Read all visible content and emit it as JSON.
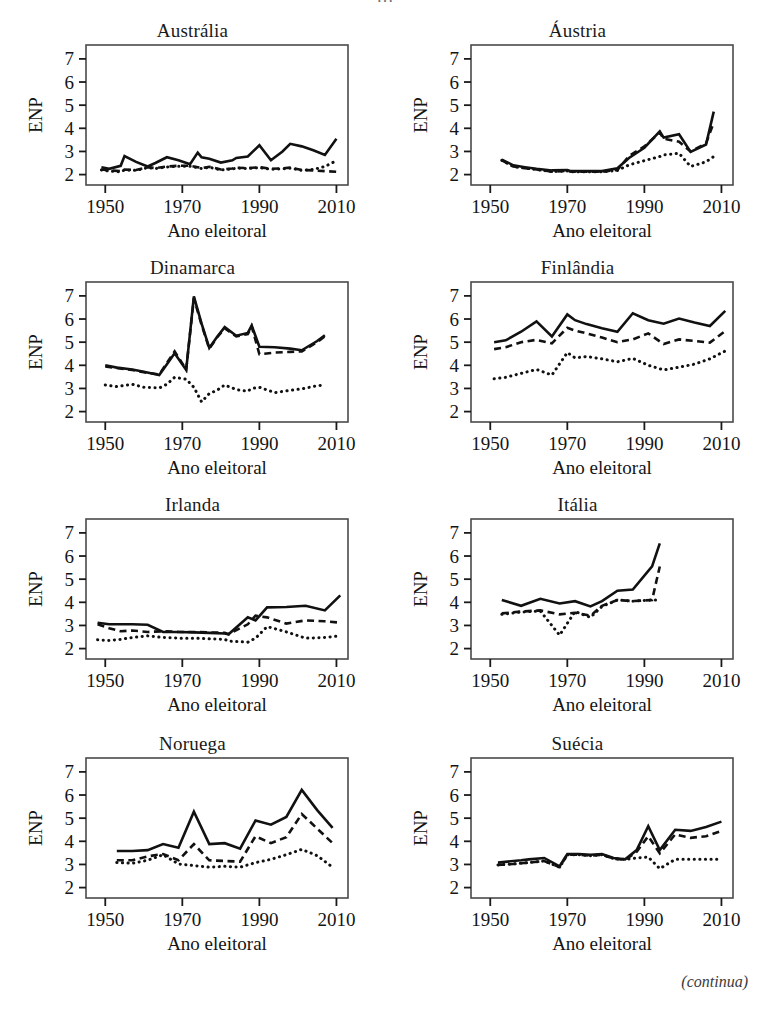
{
  "figure": {
    "cropped_header_text": "…",
    "continued_note": "(continua)",
    "axis": {
      "xlabel": "Ano eleitoral",
      "ylabel": "ENP",
      "x_ticks": [
        1950,
        1970,
        1990,
        2010
      ],
      "y_ticks": [
        2,
        3,
        4,
        5,
        6,
        7
      ],
      "xlim": [
        1945,
        2013
      ],
      "ylim": [
        1.55,
        7.6
      ]
    },
    "series_styles": [
      "solid",
      "dashed",
      "dotted"
    ],
    "line_color": "#111111"
  },
  "chart_data": [
    {
      "type": "line",
      "title": "Austrália",
      "xlabel": "Ano eleitoral",
      "ylabel": "ENP",
      "xlim": [
        1945,
        2013
      ],
      "ylim": [
        1.55,
        7.6
      ],
      "x_ticks": [
        1950,
        1970,
        1990,
        2010
      ],
      "y_ticks": [
        2,
        3,
        4,
        5,
        6,
        7
      ],
      "grid": false,
      "legend": "none",
      "x": [
        1949,
        1951,
        1954,
        1955,
        1958,
        1961,
        1963,
        1966,
        1969,
        1972,
        1974,
        1975,
        1977,
        1980,
        1983,
        1984,
        1987,
        1990,
        1993,
        1996,
        1998,
        2001,
        2004,
        2007,
        2010
      ],
      "series": [
        {
          "name": "solid",
          "style": "solid",
          "values": [
            2.32,
            2.25,
            2.38,
            2.8,
            2.55,
            2.35,
            2.5,
            2.75,
            2.62,
            2.45,
            2.95,
            2.75,
            2.68,
            2.52,
            2.62,
            2.72,
            2.78,
            3.27,
            2.62,
            3.0,
            3.33,
            3.22,
            3.05,
            2.85,
            3.55
          ]
        },
        {
          "name": "dashed",
          "style": "dashed",
          "values": [
            2.22,
            2.18,
            2.15,
            2.22,
            2.2,
            2.32,
            2.28,
            2.35,
            2.38,
            2.38,
            2.32,
            2.28,
            2.34,
            2.22,
            2.26,
            2.3,
            2.28,
            2.32,
            2.25,
            2.27,
            2.3,
            2.2,
            2.18,
            2.15,
            2.12
          ]
        },
        {
          "name": "dotted",
          "style": "dotted",
          "values": [
            2.2,
            2.15,
            2.12,
            2.2,
            2.18,
            2.3,
            2.26,
            2.33,
            2.36,
            2.36,
            2.3,
            2.26,
            2.32,
            2.2,
            2.24,
            2.28,
            2.26,
            2.3,
            2.23,
            2.25,
            2.28,
            2.18,
            2.22,
            2.35,
            2.6
          ]
        }
      ]
    },
    {
      "type": "line",
      "title": "Áustria",
      "xlabel": "Ano eleitoral",
      "ylabel": "ENP",
      "xlim": [
        1945,
        2013
      ],
      "ylim": [
        1.55,
        7.6
      ],
      "x_ticks": [
        1950,
        1970,
        1990,
        2010
      ],
      "y_ticks": [
        2,
        3,
        4,
        5,
        6,
        7
      ],
      "grid": false,
      "legend": "none",
      "x": [
        1953,
        1956,
        1959,
        1962,
        1966,
        1970,
        1971,
        1975,
        1979,
        1983,
        1986,
        1990,
        1994,
        1995,
        1999,
        2002,
        2006,
        2008
      ],
      "series": [
        {
          "name": "solid",
          "style": "solid",
          "values": [
            2.65,
            2.4,
            2.32,
            2.25,
            2.18,
            2.2,
            2.15,
            2.15,
            2.15,
            2.27,
            2.72,
            3.16,
            3.87,
            3.6,
            3.74,
            2.98,
            3.3,
            4.72
          ]
        },
        {
          "name": "dashed",
          "style": "dashed",
          "values": [
            2.62,
            2.35,
            2.28,
            2.22,
            2.13,
            2.16,
            2.12,
            2.12,
            2.12,
            2.2,
            2.8,
            3.22,
            3.82,
            3.55,
            3.42,
            3.0,
            3.35,
            4.25
          ]
        },
        {
          "name": "dotted",
          "style": "dotted",
          "values": [
            2.62,
            2.35,
            2.28,
            2.22,
            2.13,
            2.16,
            2.12,
            2.12,
            2.12,
            2.18,
            2.42,
            2.6,
            2.78,
            2.85,
            2.92,
            2.35,
            2.55,
            2.78
          ]
        }
      ]
    },
    {
      "type": "line",
      "title": "Dinamarca",
      "xlabel": "Ano eleitoral",
      "ylabel": "ENP",
      "xlim": [
        1945,
        2013
      ],
      "ylim": [
        1.55,
        7.6
      ],
      "x_ticks": [
        1950,
        1970,
        1990,
        2010
      ],
      "y_ticks": [
        2,
        3,
        4,
        5,
        6,
        7
      ],
      "grid": false,
      "legend": "none",
      "x": [
        1950,
        1953,
        1957,
        1960,
        1964,
        1966,
        1968,
        1971,
        1973,
        1975,
        1977,
        1979,
        1981,
        1984,
        1987,
        1988,
        1990,
        1994,
        1998,
        2001,
        2005,
        2007
      ],
      "series": [
        {
          "name": "solid",
          "style": "solid",
          "values": [
            4.0,
            3.9,
            3.82,
            3.72,
            3.58,
            4.05,
            4.52,
            3.8,
            6.98,
            5.8,
            4.75,
            5.22,
            5.65,
            5.28,
            5.4,
            5.72,
            4.8,
            4.78,
            4.72,
            4.65,
            5.05,
            5.3
          ]
        },
        {
          "name": "dashed",
          "style": "dashed",
          "values": [
            3.95,
            3.88,
            3.8,
            3.7,
            3.6,
            4.1,
            4.6,
            3.82,
            6.9,
            5.75,
            4.72,
            5.2,
            5.6,
            5.25,
            5.35,
            5.68,
            4.48,
            4.55,
            4.58,
            4.6,
            5.0,
            5.25
          ]
        },
        {
          "name": "dotted",
          "style": "dotted",
          "values": [
            3.15,
            3.08,
            3.18,
            3.05,
            3.02,
            3.18,
            3.48,
            3.4,
            3.05,
            2.42,
            2.78,
            2.92,
            3.15,
            2.95,
            2.88,
            3.0,
            3.05,
            2.82,
            2.92,
            2.98,
            3.12,
            3.15
          ]
        }
      ]
    },
    {
      "type": "line",
      "title": "Finlândia",
      "xlabel": "Ano eleitoral",
      "ylabel": "ENP",
      "xlim": [
        1945,
        2013
      ],
      "ylim": [
        1.55,
        7.6
      ],
      "x_ticks": [
        1950,
        1970,
        1990,
        2010
      ],
      "y_ticks": [
        2,
        3,
        4,
        5,
        6,
        7
      ],
      "grid": false,
      "legend": "none",
      "x": [
        1951,
        1954,
        1958,
        1962,
        1966,
        1970,
        1972,
        1975,
        1979,
        1983,
        1987,
        1991,
        1995,
        1999,
        2003,
        2007,
        2011
      ],
      "series": [
        {
          "name": "solid",
          "style": "solid",
          "values": [
            5.0,
            5.08,
            5.45,
            5.9,
            5.25,
            6.2,
            5.95,
            5.78,
            5.6,
            5.45,
            6.25,
            5.95,
            5.8,
            6.02,
            5.85,
            5.7,
            6.35
          ]
        },
        {
          "name": "dashed",
          "style": "dashed",
          "values": [
            4.7,
            4.78,
            5.0,
            5.1,
            4.95,
            5.62,
            5.5,
            5.38,
            5.2,
            5.0,
            5.12,
            5.38,
            4.92,
            5.12,
            5.05,
            4.98,
            5.48
          ]
        },
        {
          "name": "dotted",
          "style": "dotted",
          "values": [
            3.42,
            3.48,
            3.65,
            3.82,
            3.58,
            4.55,
            4.32,
            4.38,
            4.28,
            4.15,
            4.3,
            4.0,
            3.8,
            3.92,
            4.05,
            4.28,
            4.62
          ]
        }
      ]
    },
    {
      "type": "line",
      "title": "Irlanda",
      "xlabel": "Ano eleitoral",
      "ylabel": "ENP",
      "xlim": [
        1945,
        2013
      ],
      "ylim": [
        1.55,
        7.6
      ],
      "x_ticks": [
        1950,
        1970,
        1990,
        2010
      ],
      "y_ticks": [
        2,
        3,
        4,
        5,
        6,
        7
      ],
      "grid": false,
      "legend": "none",
      "x": [
        1948,
        1951,
        1954,
        1957,
        1961,
        1965,
        1969,
        1973,
        1977,
        1981,
        1982,
        1987,
        1989,
        1992,
        1997,
        2002,
        2007,
        2011
      ],
      "series": [
        {
          "name": "solid",
          "style": "solid",
          "values": [
            3.12,
            3.05,
            3.05,
            3.05,
            3.03,
            2.72,
            2.72,
            2.7,
            2.68,
            2.65,
            2.62,
            3.35,
            3.22,
            3.78,
            3.8,
            3.85,
            3.65,
            4.3
          ]
        },
        {
          "name": "dashed",
          "style": "dashed",
          "values": [
            3.05,
            2.88,
            2.75,
            2.78,
            2.72,
            2.75,
            2.72,
            2.72,
            2.7,
            2.68,
            2.62,
            3.05,
            3.42,
            3.35,
            3.08,
            3.22,
            3.18,
            3.12
          ]
        },
        {
          "name": "dotted",
          "style": "dotted",
          "values": [
            2.38,
            2.35,
            2.4,
            2.48,
            2.55,
            2.48,
            2.45,
            2.45,
            2.42,
            2.4,
            2.32,
            2.28,
            2.45,
            2.95,
            2.72,
            2.45,
            2.48,
            2.55
          ]
        }
      ]
    },
    {
      "type": "line",
      "title": "Itália",
      "xlabel": "Ano eleitoral",
      "ylabel": "ENP",
      "xlim": [
        1945,
        2013
      ],
      "ylim": [
        1.55,
        7.6
      ],
      "x_ticks": [
        1950,
        1970,
        1990,
        2010
      ],
      "y_ticks": [
        2,
        3,
        4,
        5,
        6,
        7
      ],
      "grid": false,
      "legend": "none",
      "x": [
        1953,
        1958,
        1963,
        1968,
        1972,
        1976,
        1979,
        1983,
        1987,
        1992,
        1994
      ],
      "series": [
        {
          "name": "solid",
          "style": "solid",
          "values": [
            4.1,
            3.85,
            4.15,
            3.95,
            4.05,
            3.82,
            4.05,
            4.5,
            4.55,
            5.55,
            6.55
          ]
        },
        {
          "name": "dashed",
          "style": "dashed",
          "values": [
            3.52,
            3.6,
            3.65,
            3.48,
            3.55,
            3.42,
            3.85,
            4.1,
            4.05,
            4.1,
            5.55
          ]
        },
        {
          "name": "dotted",
          "style": "dotted",
          "values": [
            3.48,
            3.58,
            3.62,
            2.58,
            3.6,
            3.35,
            3.82,
            4.1,
            4.05,
            4.1,
            4.1
          ]
        }
      ]
    },
    {
      "type": "line",
      "title": "Noruega",
      "xlabel": "Ano eleitoral",
      "ylabel": "ENP",
      "xlim": [
        1945,
        2013
      ],
      "ylim": [
        1.55,
        7.6
      ],
      "x_ticks": [
        1950,
        1970,
        1990,
        2010
      ],
      "y_ticks": [
        2,
        3,
        4,
        5,
        6,
        7
      ],
      "grid": false,
      "legend": "none",
      "x": [
        1953,
        1957,
        1961,
        1965,
        1969,
        1973,
        1977,
        1981,
        1985,
        1989,
        1993,
        1997,
        2001,
        2005,
        2009
      ],
      "series": [
        {
          "name": "solid",
          "style": "solid",
          "values": [
            3.58,
            3.58,
            3.62,
            3.88,
            3.72,
            5.28,
            3.88,
            3.92,
            3.68,
            4.9,
            4.72,
            5.05,
            6.22,
            5.35,
            4.58
          ]
        },
        {
          "name": "dashed",
          "style": "dashed",
          "values": [
            3.18,
            3.18,
            3.35,
            3.45,
            3.18,
            3.88,
            3.18,
            3.15,
            3.12,
            4.22,
            3.92,
            4.18,
            5.18,
            4.55,
            3.92
          ]
        },
        {
          "name": "dotted",
          "style": "dotted",
          "values": [
            3.08,
            3.05,
            3.18,
            3.42,
            3.02,
            2.95,
            2.88,
            2.92,
            2.88,
            3.08,
            3.22,
            3.42,
            3.65,
            3.38,
            2.88
          ]
        }
      ]
    },
    {
      "type": "line",
      "title": "Suécia",
      "xlabel": "Ano eleitoral",
      "ylabel": "ENP",
      "xlim": [
        1945,
        2013
      ],
      "ylim": [
        1.55,
        7.6
      ],
      "x_ticks": [
        1950,
        1970,
        1990,
        2010
      ],
      "y_ticks": [
        2,
        3,
        4,
        5,
        6,
        7
      ],
      "grid": false,
      "legend": "none",
      "x": [
        1952,
        1956,
        1958,
        1960,
        1964,
        1968,
        1970,
        1973,
        1976,
        1979,
        1982,
        1985,
        1988,
        1991,
        1994,
        1998,
        2002,
        2006,
        2010
      ],
      "series": [
        {
          "name": "solid",
          "style": "solid",
          "values": [
            3.08,
            3.15,
            3.18,
            3.22,
            3.28,
            2.92,
            3.45,
            3.45,
            3.42,
            3.45,
            3.28,
            3.22,
            3.62,
            4.65,
            3.62,
            4.5,
            4.45,
            4.62,
            4.85
          ]
        },
        {
          "name": "dashed",
          "style": "dashed",
          "values": [
            2.98,
            3.02,
            3.05,
            3.08,
            3.15,
            2.88,
            3.42,
            3.42,
            3.38,
            3.42,
            3.25,
            3.2,
            3.55,
            4.22,
            3.48,
            4.3,
            4.15,
            4.22,
            4.45
          ]
        },
        {
          "name": "dotted",
          "style": "dotted",
          "values": [
            2.98,
            3.02,
            3.05,
            3.08,
            3.15,
            2.88,
            3.42,
            3.42,
            3.38,
            3.42,
            3.25,
            3.22,
            3.28,
            3.32,
            2.82,
            3.22,
            3.22,
            3.22,
            3.22
          ]
        }
      ]
    }
  ]
}
